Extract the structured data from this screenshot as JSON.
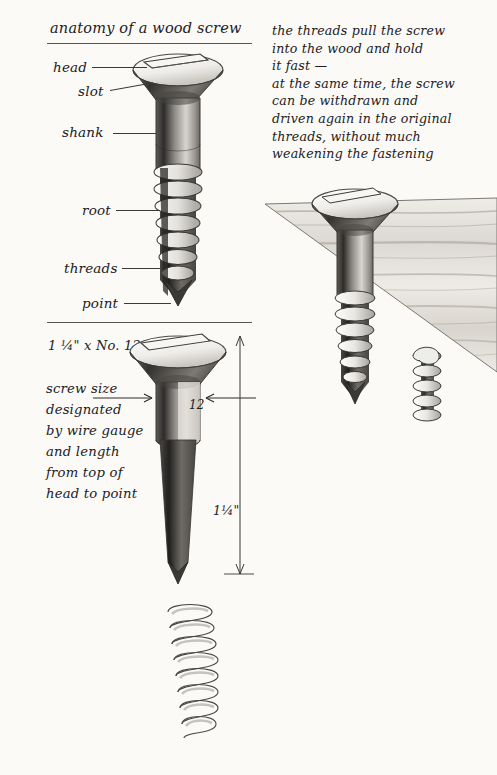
{
  "page": {
    "background": "#fbfaf7",
    "ink": "#21201e"
  },
  "section_top": {
    "title": "anatomy of a wood screw",
    "labels": [
      {
        "key": "head",
        "text": "head"
      },
      {
        "key": "slot",
        "text": "slot"
      },
      {
        "key": "shank",
        "text": "shank"
      },
      {
        "key": "root",
        "text": "root"
      },
      {
        "key": "threads",
        "text": "threads"
      },
      {
        "key": "point",
        "text": "point"
      }
    ]
  },
  "note": {
    "lines": [
      "the threads pull the screw",
      "into the wood and hold",
      "it fast —",
      "at the same time, the screw",
      "can be withdrawn and",
      "driven again in the original",
      "threads, without much",
      "weakening the fastening"
    ]
  },
  "section_bottom": {
    "heading": "1 ¼\" x No. 12",
    "caption_lines": [
      "screw size",
      "designated",
      "by wire gauge",
      "and length",
      "from top of",
      "head to point"
    ],
    "gauge_label": "12",
    "length_label": "1¼\""
  },
  "figures": {
    "top_screw": "wood-screw-cutaway-diagram",
    "wood_block": "screw-driven-into-wood-grain-block",
    "sized_screw": "dimensioned-wood-screw",
    "helix": "detached-thread-helix"
  }
}
